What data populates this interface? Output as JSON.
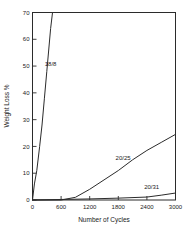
{
  "chart_data": {
    "type": "line",
    "title": "",
    "xlabel": "Number of Cycles",
    "ylabel": "Weight Loss %",
    "xlim": [
      0,
      3000
    ],
    "ylim": [
      0,
      70
    ],
    "grid": false,
    "legend_position": "inline-labels",
    "xticks": [
      0,
      600,
      1200,
      1800,
      2400,
      3000
    ],
    "xtick_labels": [
      "0",
      "600",
      "1200",
      "1800",
      "2400",
      "3000"
    ],
    "yticks": [
      0,
      10,
      20,
      30,
      40,
      50,
      60,
      70
    ],
    "ytick_labels": [
      "0",
      "10",
      "20",
      "30",
      "40",
      "50",
      "60",
      "70"
    ],
    "series": [
      {
        "name": "18/8",
        "label": "18/8",
        "x": [
          0,
          40,
          90,
          150,
          200,
          250,
          300,
          340,
          380,
          420
        ],
        "values": [
          0,
          6,
          11,
          20,
          28,
          38,
          48,
          56,
          64,
          70
        ]
      },
      {
        "name": "20/25",
        "label": "20/25",
        "x": [
          0,
          600,
          900,
          1200,
          1500,
          1800,
          2100,
          2400,
          2700,
          3000
        ],
        "values": [
          0,
          0,
          1,
          4,
          7.5,
          11,
          15,
          18.5,
          21.5,
          24.5
        ]
      },
      {
        "name": "20/31",
        "label": "20/31",
        "x": [
          0,
          600,
          1200,
          1800,
          2400,
          2700,
          3000
        ],
        "values": [
          0,
          0.2,
          0.4,
          0.7,
          1.1,
          1.8,
          2.6
        ]
      }
    ],
    "annotations": [
      {
        "text": "18/8",
        "x": 380,
        "y": 50
      },
      {
        "text": "20/25",
        "x": 1900,
        "y": 15
      },
      {
        "text": "20/31",
        "x": 2500,
        "y": 4
      }
    ],
    "colors": {
      "axis": "#2b2b2b",
      "curve": "#2b2b2b",
      "background": "#ffffff",
      "text": "#1a1a1a"
    }
  }
}
